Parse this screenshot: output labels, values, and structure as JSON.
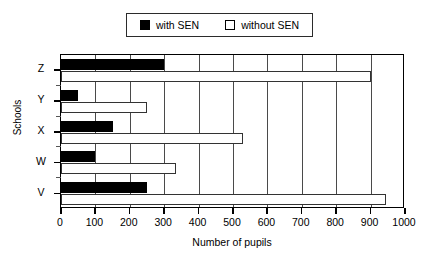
{
  "legend": {
    "entries": [
      {
        "label": "with SEN",
        "swatch": "filled-square-icon",
        "color": "#000000"
      },
      {
        "label": "without SEN",
        "swatch": "hollow-square-icon",
        "color": "#ffffff"
      }
    ]
  },
  "chart_data": {
    "type": "bar",
    "orientation": "horizontal",
    "title": "",
    "xlabel": "Number of pupils",
    "ylabel": "Schools",
    "categories": [
      "V",
      "W",
      "X",
      "Y",
      "Z"
    ],
    "series": [
      {
        "name": "with SEN",
        "values": [
          250,
          100,
          150,
          50,
          300
        ]
      },
      {
        "name": "without SEN",
        "values": [
          945,
          335,
          530,
          250,
          900
        ]
      }
    ],
    "xlim": [
      0,
      1000
    ],
    "xticks": [
      0,
      100,
      200,
      300,
      400,
      500,
      600,
      700,
      800,
      900,
      1000
    ],
    "xticklabels": [
      "0",
      "100",
      "200",
      "300",
      "400",
      "500",
      "600",
      "700",
      "800",
      "900",
      "1000"
    ],
    "grid": true,
    "grid_axis": "x",
    "legend_position": "top-center"
  }
}
